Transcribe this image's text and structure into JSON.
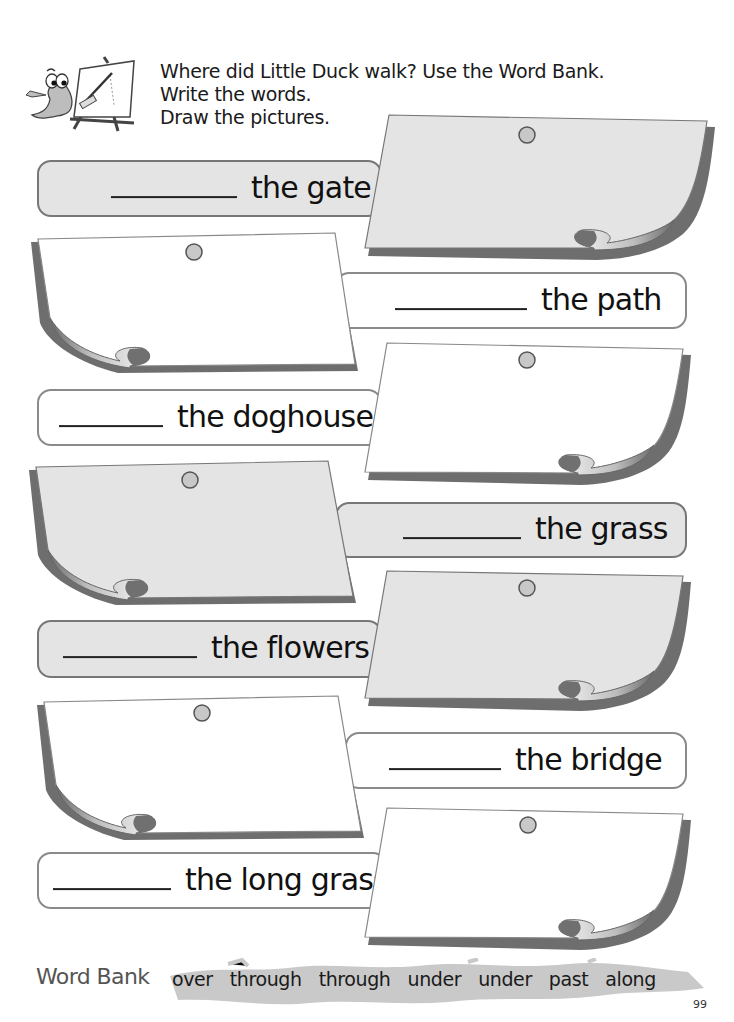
{
  "instructions": {
    "line1": "Where did Little Duck walk? Use the Word Bank.",
    "line2": "Write the words.",
    "line3": "Draw the pictures."
  },
  "mascot": {
    "icon": "duck-at-easel-icon"
  },
  "rows": [
    {
      "phrase": "the gate",
      "answer": "",
      "style": "gray",
      "note_side": "right"
    },
    {
      "phrase": "the path",
      "answer": "",
      "style": "white",
      "note_side": "left"
    },
    {
      "phrase": "the doghouse",
      "answer": "",
      "style": "white",
      "note_side": "right"
    },
    {
      "phrase": "the grass",
      "answer": "",
      "style": "gray",
      "note_side": "left"
    },
    {
      "phrase": "the flowers",
      "answer": "",
      "style": "gray",
      "note_side": "right"
    },
    {
      "phrase": "the bridge",
      "answer": "",
      "style": "white",
      "note_side": "left"
    },
    {
      "phrase": "the long grass",
      "answer": "",
      "style": "white",
      "note_side": "right"
    }
  ],
  "word_bank": {
    "title": "Word Bank",
    "words": [
      "over",
      "through",
      "through",
      "under",
      "under",
      "past",
      "along"
    ]
  },
  "page_number": "99",
  "colors": {
    "gray_fill": "#e4e4e4",
    "white_fill": "#ffffff",
    "border": "#777777",
    "shadow": "#6e6e6e",
    "pin": "#c8c8c8"
  }
}
